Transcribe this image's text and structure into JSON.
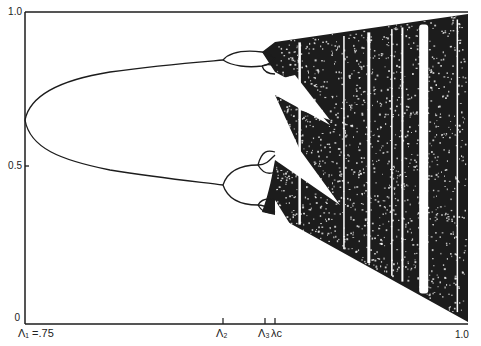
{
  "chart_data": {
    "type": "scatter",
    "subtype": "bifurcation-diagram",
    "title": "",
    "xlabel": "",
    "ylabel": "",
    "xlim": [
      0.75,
      1.0
    ],
    "ylim": [
      0,
      1.0
    ],
    "grid": false,
    "legend": null,
    "y_ticks": [
      {
        "value": 0,
        "label": "0"
      },
      {
        "value": 0.5,
        "label": "0.5"
      },
      {
        "value": 1.0,
        "label": "1.0"
      }
    ],
    "x_ticks": [
      {
        "id": "lambda1",
        "value": 0.75,
        "label": "Λ₁ =.75"
      },
      {
        "id": "lambda2",
        "value": 0.862,
        "label": "Λ₂"
      },
      {
        "id": "lambda3",
        "value": 0.886,
        "label": "Λ₃"
      },
      {
        "id": "lambdac",
        "value": 0.892,
        "label": "λc"
      },
      {
        "id": "one",
        "value": 1.0,
        "label": "1.0"
      }
    ],
    "period1_branch": {
      "x_start": 0.75,
      "x_end": 0.75,
      "y": 0.667
    },
    "period2_branches": {
      "x_range": [
        0.75,
        0.862
      ],
      "upper_end": 0.85,
      "lower_end": 0.43
    },
    "period4_branches": {
      "x_range": [
        0.862,
        0.886
      ],
      "values_at_end": [
        0.89,
        0.82,
        0.53,
        0.38
      ]
    },
    "chaotic_region": {
      "x_range": [
        0.892,
        1.0
      ],
      "y_range_at_end": [
        0,
        1.0
      ]
    },
    "periodic_windows_x": [
      0.905,
      0.93,
      0.944,
      0.957,
      0.963,
      0.975,
      0.994
    ],
    "annotations": []
  },
  "axes": {
    "y_top_label": "1.0",
    "y_mid_label": "0.5",
    "y_bottom_label": "0",
    "x_label_lambda1": "Λ₁ =.75",
    "x_label_lambda2": "Λ₂",
    "x_label_lambda3": "Λ₃",
    "x_label_lambdac": "λc",
    "x_label_end": "1.0"
  },
  "colors": {
    "ink": "#1c1c1c",
    "background": "#ffffff"
  }
}
